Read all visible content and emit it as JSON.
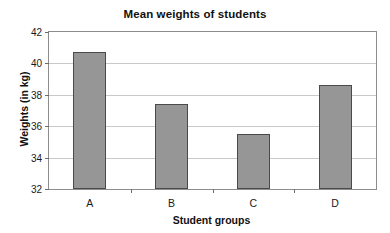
{
  "chart_data": {
    "type": "bar",
    "title": "Mean weights of students",
    "xlabel": "Student groups",
    "ylabel": "Weights (in kg)",
    "categories": [
      "A",
      "B",
      "C",
      "D"
    ],
    "values": [
      40.7,
      37.4,
      35.5,
      38.65
    ],
    "ylim": [
      32,
      42
    ],
    "ytick_labels": [
      "32",
      "34",
      "36",
      "38",
      "40",
      "42"
    ],
    "ytick_values": [
      32,
      34,
      36,
      38,
      40,
      42
    ],
    "grid": true,
    "legend": false,
    "legend_position": "none",
    "bar_color": "#969696",
    "bar_border_color": "#4a4a4a",
    "gridline_color": "#c9c9c9",
    "axis_color": "#8d8d8d",
    "background": "#ffffff"
  }
}
